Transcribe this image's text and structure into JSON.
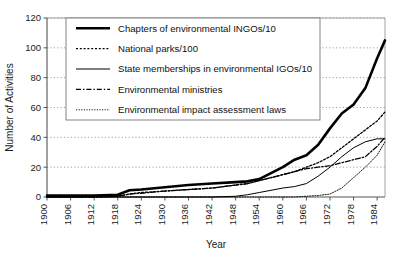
{
  "chart_data": {
    "type": "line",
    "title": "",
    "xlabel": "Year",
    "ylabel": "Number of Activities",
    "xlim": [
      1900,
      1986
    ],
    "ylim": [
      0,
      120
    ],
    "yticks": [
      0,
      20,
      40,
      60,
      80,
      100,
      120
    ],
    "xticks": [
      1900,
      1906,
      1912,
      1918,
      1924,
      1930,
      1936,
      1942,
      1948,
      1954,
      1960,
      1966,
      1972,
      1978,
      1984
    ],
    "grid": "horizontal-dotted",
    "legend_position": "top-center",
    "x": [
      1900,
      1906,
      1912,
      1918,
      1921,
      1924,
      1930,
      1936,
      1942,
      1948,
      1951,
      1954,
      1957,
      1960,
      1963,
      1966,
      1969,
      1972,
      1975,
      1978,
      1981,
      1984,
      1986
    ],
    "series": [
      {
        "name": "Chapters of environmental INGOs/10",
        "style": "thick-solid",
        "color": "#000000",
        "values": [
          1,
          1,
          1,
          1.5,
          4.5,
          5,
          6.5,
          8,
          9,
          10,
          10.5,
          12,
          16,
          20,
          25,
          28,
          35,
          46,
          56,
          62,
          73,
          93,
          105
        ]
      },
      {
        "name": "National parks/100",
        "style": "coarse-dotted",
        "color": "#000000",
        "values": [
          0,
          0,
          0,
          0.5,
          2,
          3,
          4,
          5,
          6,
          8,
          9,
          11,
          13,
          15,
          17,
          20,
          23,
          27,
          33,
          39,
          45,
          51,
          57
        ]
      },
      {
        "name": "State memberships in environmental IGOs/10",
        "style": "medium-solid",
        "color": "#000000",
        "values": [
          0,
          0,
          0,
          0,
          0,
          0,
          0,
          0,
          0,
          0.5,
          1.5,
          3,
          4.5,
          6,
          7,
          9,
          14,
          20,
          27,
          33,
          37,
          39,
          39
        ]
      },
      {
        "name": "Environmental ministries",
        "style": "dash-dot",
        "color": "#000000",
        "values": [
          0,
          0,
          0,
          0.5,
          2,
          2.5,
          4,
          5,
          6,
          8,
          9,
          11,
          13,
          15,
          17,
          19,
          20,
          21,
          23,
          25,
          27,
          34,
          40
        ]
      },
      {
        "name": "Environmental impact assessment laws",
        "style": "fine-dotted",
        "color": "#000000",
        "values": [
          0,
          0,
          0,
          0,
          0,
          0,
          0,
          0,
          0,
          0,
          0,
          0,
          0,
          0,
          0,
          0.5,
          1,
          2,
          6,
          13,
          20,
          28,
          37
        ]
      }
    ],
    "legend": [
      "Chapters of environmental INGOs/10",
      "National parks/100",
      "State memberships in environmental IGOs/10",
      "Environmental ministries",
      "Environmental impact assessment laws"
    ]
  }
}
